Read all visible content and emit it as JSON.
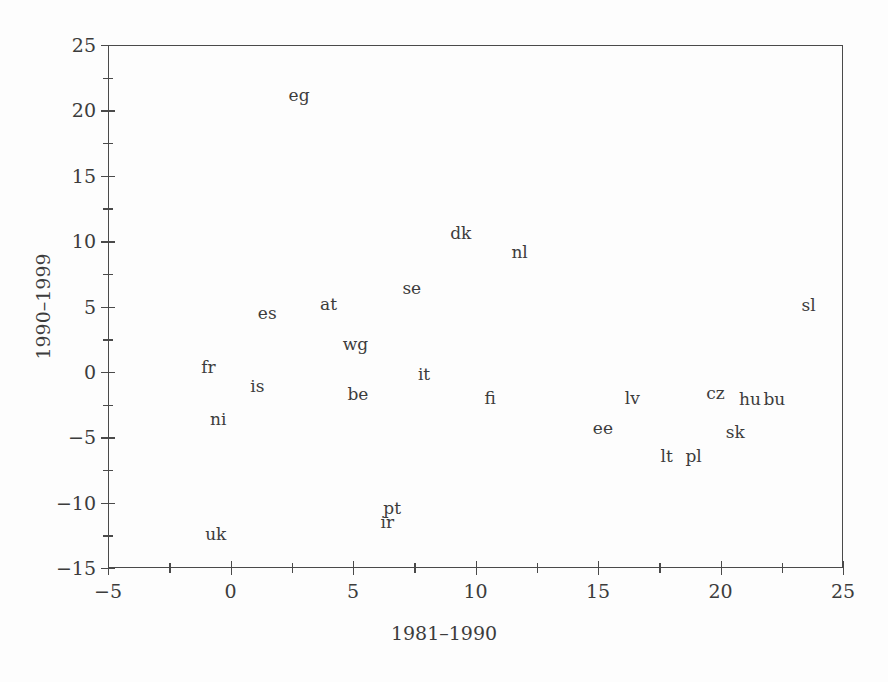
{
  "chart_data": {
    "type": "scatter",
    "title": "",
    "xlabel": "1981–1990",
    "ylabel": "1990–1999",
    "xlim": [
      -5,
      25
    ],
    "ylim": [
      -15,
      25
    ],
    "grid": false,
    "legend": null,
    "point_style": "text-label",
    "xticks": [
      -5,
      0,
      5,
      10,
      15,
      20,
      25
    ],
    "xtick_labels": [
      "−5",
      "0",
      "5",
      "10",
      "15",
      "20",
      "25"
    ],
    "xminorticks": [
      -2.5,
      2.5,
      7.5,
      12.5,
      17.5,
      22.5
    ],
    "yticks": [
      -15,
      -10,
      -5,
      0,
      5,
      10,
      15,
      20,
      25
    ],
    "ytick_labels": [
      "−15",
      "−10",
      "−5",
      "0",
      "5",
      "10",
      "15",
      "20",
      "25"
    ],
    "yminorticks": [
      -12.5,
      -7.5,
      -2.5,
      2.5,
      7.5,
      12.5,
      17.5,
      22.5
    ],
    "points": [
      {
        "label": "eg",
        "x": 2.8,
        "y": 21.2
      },
      {
        "label": "dk",
        "x": 9.4,
        "y": 10.6
      },
      {
        "label": "nl",
        "x": 11.8,
        "y": 9.2
      },
      {
        "label": "se",
        "x": 7.4,
        "y": 6.4
      },
      {
        "label": "sl",
        "x": 23.6,
        "y": 5.1
      },
      {
        "label": "at",
        "x": 4.0,
        "y": 5.2
      },
      {
        "label": "es",
        "x": 1.5,
        "y": 4.5
      },
      {
        "label": "wg",
        "x": 5.1,
        "y": 2.1
      },
      {
        "label": "fr",
        "x": -0.9,
        "y": 0.4
      },
      {
        "label": "it",
        "x": 7.9,
        "y": -0.2
      },
      {
        "label": "is",
        "x": 1.1,
        "y": -1.1
      },
      {
        "label": "be",
        "x": 5.2,
        "y": -1.7
      },
      {
        "label": "fi",
        "x": 10.6,
        "y": -2.0
      },
      {
        "label": "lv",
        "x": 16.4,
        "y": -2.0
      },
      {
        "label": "cz",
        "x": 19.8,
        "y": -1.6
      },
      {
        "label": "hu",
        "x": 21.2,
        "y": -2.1
      },
      {
        "label": "bu",
        "x": 22.2,
        "y": -2.1
      },
      {
        "label": "ni",
        "x": -0.5,
        "y": -3.6
      },
      {
        "label": "ee",
        "x": 15.2,
        "y": -4.3
      },
      {
        "label": "sk",
        "x": 20.6,
        "y": -4.6
      },
      {
        "label": "lt",
        "x": 17.8,
        "y": -6.4
      },
      {
        "label": "pl",
        "x": 18.9,
        "y": -6.4
      },
      {
        "label": "pt",
        "x": 6.6,
        "y": -10.4
      },
      {
        "label": "ir",
        "x": 6.4,
        "y": -11.5
      },
      {
        "label": "uk",
        "x": -0.6,
        "y": -12.4
      }
    ]
  },
  "colors": {
    "axis": "#4a4a4a",
    "text": "#3c3c3c",
    "background": "#fdfdfd"
  }
}
